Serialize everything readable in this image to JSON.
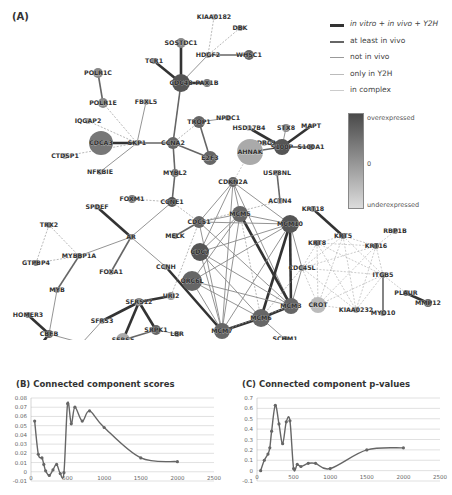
{
  "panels": {
    "a_label": "(A)",
    "b_title": "(B) Connected component scores",
    "c_title": "(C) Connected component p-values"
  },
  "legend": {
    "edges": [
      {
        "label": "in vitro + in vivo + Y2H",
        "color": "#333333",
        "width": 3
      },
      {
        "label": "at least in vivo",
        "color": "#666666",
        "width": 2
      },
      {
        "label": "not in vivo",
        "color": "#999999",
        "width": 1.2
      },
      {
        "label": "only in Y2H",
        "color": "#bbbbbb",
        "width": 1.2
      },
      {
        "label": "in complex",
        "color": "#cccccc",
        "width": 1
      }
    ],
    "colorbar": {
      "top": "overexpressed",
      "mid": "0",
      "bottom": "underexpressed"
    }
  },
  "network": {
    "nodes": [
      {
        "id": "KIAA0182",
        "x": 214,
        "y": 17,
        "r": 3,
        "c": "#bbb"
      },
      {
        "id": "DBK",
        "x": 240,
        "y": 28,
        "r": 3,
        "c": "#888"
      },
      {
        "id": "SOSTDC1",
        "x": 181,
        "y": 43,
        "r": 5,
        "c": "#888"
      },
      {
        "id": "HDGF2",
        "x": 208,
        "y": 55,
        "r": 3,
        "c": "#999"
      },
      {
        "id": "WHSC1",
        "x": 249,
        "y": 55,
        "r": 5,
        "c": "#666"
      },
      {
        "id": "TCR1",
        "x": 154,
        "y": 61,
        "r": 3,
        "c": "#888"
      },
      {
        "id": "CDC48",
        "x": 181,
        "y": 83,
        "r": 9,
        "c": "#555"
      },
      {
        "id": "PAX1B",
        "x": 207,
        "y": 83,
        "r": 4,
        "c": "#777"
      },
      {
        "id": "POLR1C",
        "x": 98,
        "y": 73,
        "r": 5,
        "c": "#888"
      },
      {
        "id": "POLR1E",
        "x": 103,
        "y": 103,
        "r": 5,
        "c": "#888"
      },
      {
        "id": "FBXL5",
        "x": 146,
        "y": 102,
        "r": 3,
        "c": "#999"
      },
      {
        "id": "IQGAP2",
        "x": 88,
        "y": 121,
        "r": 3,
        "c": "#aaa"
      },
      {
        "id": "TROP1",
        "x": 199,
        "y": 122,
        "r": 6,
        "c": "#666"
      },
      {
        "id": "NPDC1",
        "x": 228,
        "y": 118,
        "r": 3,
        "c": "#999"
      },
      {
        "id": "CDCA3",
        "x": 101,
        "y": 143,
        "r": 12,
        "c": "#777"
      },
      {
        "id": "SKP1",
        "x": 137,
        "y": 143,
        "r": 3,
        "c": "#999"
      },
      {
        "id": "CCNA2",
        "x": 173,
        "y": 143,
        "r": 6,
        "c": "#666"
      },
      {
        "id": "E2F3",
        "x": 210,
        "y": 158,
        "r": 7,
        "c": "#666"
      },
      {
        "id": "CTDSP1",
        "x": 65,
        "y": 156,
        "r": 3,
        "c": "#aaa"
      },
      {
        "id": "NFKBIE",
        "x": 100,
        "y": 172,
        "r": 3,
        "c": "#aaa"
      },
      {
        "id": "MYBL2",
        "x": 175,
        "y": 173,
        "r": 4,
        "c": "#777"
      },
      {
        "id": "FOXM1",
        "x": 132,
        "y": 199,
        "r": 4,
        "c": "#777"
      },
      {
        "id": "CCNE1",
        "x": 172,
        "y": 202,
        "r": 5,
        "c": "#555"
      },
      {
        "id": "SPDEF",
        "x": 97,
        "y": 207,
        "r": 3,
        "c": "#aaa"
      },
      {
        "id": "TRX2",
        "x": 49,
        "y": 225,
        "r": 3,
        "c": "#777"
      },
      {
        "id": "AR",
        "x": 131,
        "y": 237,
        "r": 3,
        "c": "#888"
      },
      {
        "id": "GTPBP4",
        "x": 36,
        "y": 263,
        "r": 3,
        "c": "#777"
      },
      {
        "id": "MYBBP1A",
        "x": 79,
        "y": 256,
        "r": 3,
        "c": "#777"
      },
      {
        "id": "FOXA1",
        "x": 111,
        "y": 272,
        "r": 3,
        "c": "#aaa"
      },
      {
        "id": "MYB",
        "x": 57,
        "y": 290,
        "r": 3,
        "c": "#888"
      },
      {
        "id": "HOMER3",
        "x": 28,
        "y": 315,
        "r": 3,
        "c": "#777"
      },
      {
        "id": "CBFB",
        "x": 49,
        "y": 334,
        "r": 4,
        "c": "#666"
      },
      {
        "id": "CEBPG",
        "x": 31,
        "y": 358,
        "r": 4,
        "c": "#555"
      },
      {
        "id": "TAF9",
        "x": 82,
        "y": 343,
        "r": 3,
        "c": "#aaa"
      },
      {
        "id": "CCNH",
        "x": 166,
        "y": 267,
        "r": 3,
        "c": "#999"
      },
      {
        "id": "URI2",
        "x": 171,
        "y": 296,
        "r": 4,
        "c": "#999"
      },
      {
        "id": "SFRS12",
        "x": 139,
        "y": 302,
        "r": 4,
        "c": "#888"
      },
      {
        "id": "SFRS3",
        "x": 102,
        "y": 321,
        "r": 3,
        "c": "#aaa"
      },
      {
        "id": "SRPK1",
        "x": 156,
        "y": 330,
        "r": 5,
        "c": "#666"
      },
      {
        "id": "LBR",
        "x": 177,
        "y": 334,
        "r": 3,
        "c": "#888"
      },
      {
        "id": "SFRS5",
        "x": 123,
        "y": 340,
        "r": 7,
        "c": "#aaa"
      },
      {
        "id": "HSD17B4",
        "x": 249,
        "y": 128,
        "r": 3,
        "c": "#bbb"
      },
      {
        "id": "STX8",
        "x": 286,
        "y": 128,
        "r": 4,
        "c": "#888"
      },
      {
        "id": "MAPT",
        "x": 311,
        "y": 126,
        "r": 2,
        "c": "#888"
      },
      {
        "id": "NDRG1",
        "x": 264,
        "y": 143,
        "r": 3,
        "c": "#aaa"
      },
      {
        "id": "AHNAK",
        "x": 250,
        "y": 152,
        "r": 13,
        "c": "#aaa"
      },
      {
        "id": "S100P",
        "x": 282,
        "y": 147,
        "r": 8,
        "c": "#555"
      },
      {
        "id": "S100A1",
        "x": 311,
        "y": 147,
        "r": 3,
        "c": "#777"
      },
      {
        "id": "USP8NL",
        "x": 277,
        "y": 173,
        "r": 3,
        "c": "#999"
      },
      {
        "id": "CDKN2A",
        "x": 233,
        "y": 182,
        "r": 5,
        "c": "#666"
      },
      {
        "id": "ACTN4",
        "x": 280,
        "y": 201,
        "r": 3,
        "c": "#aaa"
      },
      {
        "id": "KRT18",
        "x": 313,
        "y": 209,
        "r": 3,
        "c": "#888"
      },
      {
        "id": "MCM5",
        "x": 240,
        "y": 214,
        "r": 8,
        "c": "#666"
      },
      {
        "id": "MCM10",
        "x": 290,
        "y": 224,
        "r": 9,
        "c": "#555"
      },
      {
        "id": "CDC51",
        "x": 199,
        "y": 222,
        "r": 6,
        "c": "#666"
      },
      {
        "id": "MELK",
        "x": 175,
        "y": 236,
        "r": 3,
        "c": "#777"
      },
      {
        "id": "CDC7",
        "x": 200,
        "y": 252,
        "r": 9,
        "c": "#555"
      },
      {
        "id": "ORC6L",
        "x": 192,
        "y": 281,
        "r": 10,
        "c": "#666"
      },
      {
        "id": "RBP1B",
        "x": 395,
        "y": 231,
        "r": 3,
        "c": "#888"
      },
      {
        "id": "KRT5",
        "x": 343,
        "y": 236,
        "r": 3,
        "c": "#666"
      },
      {
        "id": "KRT8",
        "x": 317,
        "y": 243,
        "r": 3,
        "c": "#666"
      },
      {
        "id": "KRT16",
        "x": 376,
        "y": 246,
        "r": 3,
        "c": "#666"
      },
      {
        "id": "CDC45L",
        "x": 302,
        "y": 268,
        "r": 3,
        "c": "#888"
      },
      {
        "id": "ITGB5",
        "x": 383,
        "y": 275,
        "r": 3,
        "c": "#888"
      },
      {
        "id": "PLAUR",
        "x": 406,
        "y": 293,
        "r": 3,
        "c": "#666"
      },
      {
        "id": "MMP12",
        "x": 428,
        "y": 303,
        "r": 4,
        "c": "#666"
      },
      {
        "id": "CROT",
        "x": 318,
        "y": 305,
        "r": 8,
        "c": "#bbb"
      },
      {
        "id": "KIAA0232",
        "x": 356,
        "y": 310,
        "r": 3,
        "c": "#999"
      },
      {
        "id": "MYO10",
        "x": 383,
        "y": 313,
        "r": 3,
        "c": "#888"
      },
      {
        "id": "MCM3",
        "x": 291,
        "y": 306,
        "r": 8,
        "c": "#666"
      },
      {
        "id": "MCM6",
        "x": 261,
        "y": 318,
        "r": 9,
        "c": "#666"
      },
      {
        "id": "MCM7",
        "x": 222,
        "y": 331,
        "r": 8,
        "c": "#666"
      },
      {
        "id": "SCHM1",
        "x": 285,
        "y": 339,
        "r": 3,
        "c": "#666"
      }
    ],
    "edges": [
      [
        "KIAA0182",
        "HDGF2",
        3
      ],
      [
        "DBK",
        "HDGF2",
        3
      ],
      [
        "HDGF2",
        "WHSC1",
        1
      ],
      [
        "HDGF2",
        "CDC48",
        2
      ],
      [
        "SOSTDC1",
        "CDC48",
        0
      ],
      [
        "TCR1",
        "CDC48",
        0
      ],
      [
        "CDC48",
        "PAX1B",
        0
      ],
      [
        "CDC48",
        "CCNA2",
        1
      ],
      [
        "POLR1C",
        "POLR1E",
        1
      ],
      [
        "POLR1E",
        "SKP1",
        3
      ],
      [
        "IQGAP2",
        "SKP1",
        3
      ],
      [
        "FBXL5",
        "SKP1",
        2
      ],
      [
        "CDCA3",
        "SKP1",
        0
      ],
      [
        "SKP1",
        "CCNA2",
        1
      ],
      [
        "CTDSP1",
        "SKP1",
        3
      ],
      [
        "NFKBIE",
        "SKP1",
        2
      ],
      [
        "CCNA2",
        "E2F3",
        1
      ],
      [
        "CCNA2",
        "TROP1",
        3
      ],
      [
        "TROP1",
        "E2F3",
        1
      ],
      [
        "TROP1",
        "NPDC1",
        2
      ],
      [
        "CCNA2",
        "MYBL2",
        1
      ],
      [
        "MYBL2",
        "CCNE1",
        1
      ],
      [
        "FOXM1",
        "CCNE1",
        3
      ],
      [
        "CCNE1",
        "AR",
        2
      ],
      [
        "CCNE1",
        "CDC51",
        3
      ],
      [
        "SPDEF",
        "AR",
        0
      ],
      [
        "AR",
        "MYBBP1A",
        2
      ],
      [
        "AR",
        "FOXA1",
        1
      ],
      [
        "AR",
        "CCNH",
        2
      ],
      [
        "TRX2",
        "GTPBP4",
        3
      ],
      [
        "TRX2",
        "MYBBP1A",
        3
      ],
      [
        "GTPBP4",
        "MYBBP1A",
        3
      ],
      [
        "MYBBP1A",
        "MYB",
        1
      ],
      [
        "MYB",
        "CBFB",
        2
      ],
      [
        "HOMER3",
        "CBFB",
        0
      ],
      [
        "CBFB",
        "CEBPG",
        0
      ],
      [
        "CBFB",
        "TAF9",
        2
      ],
      [
        "TAF9",
        "SFRS3",
        2
      ],
      [
        "SFRS3",
        "SFRS12",
        0
      ],
      [
        "SFRS12",
        "URI2",
        0
      ],
      [
        "SFRS12",
        "SFRS5",
        0
      ],
      [
        "SFRS12",
        "SRPK1",
        0
      ],
      [
        "SFRS5",
        "SRPK1",
        1
      ],
      [
        "SRPK1",
        "LBR",
        2
      ],
      [
        "CCNH",
        "MCM7",
        0
      ],
      [
        "URI2",
        "CDC51",
        3
      ],
      [
        "HSD17B4",
        "S100P",
        0
      ],
      [
        "STX8",
        "S100P",
        2
      ],
      [
        "MAPT",
        "S100P",
        0
      ],
      [
        "NDRG1",
        "S100P",
        1
      ],
      [
        "AHNAK",
        "S100P",
        1
      ],
      [
        "S100P",
        "S100A1",
        1
      ],
      [
        "AHNAK",
        "CDKN2A",
        4
      ],
      [
        "USP8NL",
        "ACTN4",
        1
      ],
      [
        "ACTN4",
        "CDC51",
        3
      ],
      [
        "KRT18",
        "KRT5",
        0
      ],
      [
        "CDKN2A",
        "MCM5",
        2
      ],
      [
        "CDKN2A",
        "MCM10",
        2
      ],
      [
        "CDKN2A",
        "CDC51",
        2
      ],
      [
        "CDKN2A",
        "MCM3",
        2
      ],
      [
        "CDKN2A",
        "CDC7",
        2
      ],
      [
        "CDKN2A",
        "MCM7",
        2
      ],
      [
        "MCM5",
        "MCM10",
        2
      ],
      [
        "MCM5",
        "CDC51",
        2
      ],
      [
        "MCM5",
        "MCM3",
        0
      ],
      [
        "MCM5",
        "MCM7",
        2
      ],
      [
        "MCM5",
        "MCM6",
        3
      ],
      [
        "MCM5",
        "ORC6L",
        2
      ],
      [
        "MCM5",
        "CDC7",
        2
      ],
      [
        "MCM10",
        "CDC51",
        2
      ],
      [
        "MCM10",
        "MCM6",
        0
      ],
      [
        "MCM10",
        "MCM3",
        0
      ],
      [
        "MCM10",
        "MCM7",
        2
      ],
      [
        "MCM10",
        "CDC7",
        2
      ],
      [
        "MCM10",
        "CDC45L",
        2
      ],
      [
        "MCM10",
        "ORC6L",
        2
      ],
      [
        "CDC51",
        "MCM7",
        2
      ],
      [
        "CDC51",
        "MCM3",
        2
      ],
      [
        "CDC51",
        "MELK",
        1
      ],
      [
        "CDC7",
        "MCM7",
        2
      ],
      [
        "CDC7",
        "MCM3",
        2
      ],
      [
        "CDC7",
        "MCM6",
        2
      ],
      [
        "ORC6L",
        "MCM7",
        2
      ],
      [
        "ORC6L",
        "MCM3",
        2
      ],
      [
        "ORC6L",
        "MCM6",
        2
      ],
      [
        "MCM7",
        "MCM6",
        0
      ],
      [
        "MCM6",
        "MCM3",
        0
      ],
      [
        "MCM6",
        "SCHM1",
        2
      ],
      [
        "MCM7",
        "MCM3",
        3
      ],
      [
        "CDC45L",
        "MCM3",
        2
      ],
      [
        "CDC45L",
        "MCM6",
        3
      ],
      [
        "KRT5",
        "KRT8",
        4
      ],
      [
        "KRT5",
        "KRT16",
        4
      ],
      [
        "KRT5",
        "CDC45L",
        4
      ],
      [
        "KRT5",
        "ITGB5",
        4
      ],
      [
        "KRT5",
        "CROT",
        4
      ],
      [
        "KRT5",
        "KIAA0232",
        4
      ],
      [
        "KRT8",
        "KRT16",
        4
      ],
      [
        "KRT8",
        "CDC45L",
        4
      ],
      [
        "KRT8",
        "ITGB5",
        4
      ],
      [
        "KRT8",
        "CROT",
        4
      ],
      [
        "KRT8",
        "KIAA0232",
        4
      ],
      [
        "KRT16",
        "CDC45L",
        4
      ],
      [
        "KRT16",
        "ITGB5",
        4
      ],
      [
        "KRT16",
        "CROT",
        4
      ],
      [
        "KRT16",
        "KIAA0232",
        4
      ],
      [
        "KRT16",
        "RBP1B",
        4
      ],
      [
        "CDC45L",
        "ITGB5",
        4
      ],
      [
        "CDC45L",
        "CROT",
        4
      ],
      [
        "CDC45L",
        "KIAA0232",
        4
      ],
      [
        "ITGB5",
        "CROT",
        4
      ],
      [
        "ITGB5",
        "KIAA0232",
        4
      ],
      [
        "CROT",
        "KIAA0232",
        4
      ],
      [
        "ITGB5",
        "MYO10",
        1
      ],
      [
        "ITGB5",
        "PLAUR",
        4
      ],
      [
        "PLAUR",
        "MMP12",
        0
      ]
    ]
  },
  "chart_data": [
    {
      "type": "line",
      "title": "(B) Connected component scores",
      "xlabel": "",
      "ylabel": "",
      "xlim": [
        0,
        2500
      ],
      "ylim": [
        -0.01,
        0.08
      ],
      "xticks": [
        0,
        500,
        1000,
        1500,
        2000,
        2500
      ],
      "yticks": [
        -0.01,
        0,
        0.01,
        0.02,
        0.03,
        0.04,
        0.05,
        0.06,
        0.07,
        0.08
      ],
      "grid": true,
      "x": [
        50,
        100,
        150,
        175,
        200,
        250,
        300,
        350,
        400,
        450,
        500,
        550,
        600,
        700,
        800,
        1000,
        1500,
        2000
      ],
      "values": [
        0.055,
        0.019,
        0.015,
        0.008,
        0.001,
        -0.004,
        0.002,
        0.008,
        -0.002,
        -0.001,
        0.074,
        0.052,
        0.07,
        0.055,
        0.066,
        0.048,
        0.015,
        0.011
      ]
    },
    {
      "type": "line",
      "title": "(C) Connected component p-values",
      "xlabel": "",
      "ylabel": "",
      "xlim": [
        0,
        2500
      ],
      "ylim": [
        -0.1,
        0.7
      ],
      "xticks": [
        0,
        500,
        1000,
        1500,
        2000,
        2500
      ],
      "yticks": [
        -0.1,
        0,
        0.1,
        0.2,
        0.3,
        0.4,
        0.5,
        0.6,
        0.7
      ],
      "grid": true,
      "x": [
        50,
        100,
        150,
        175,
        200,
        250,
        300,
        350,
        400,
        450,
        500,
        550,
        600,
        700,
        800,
        1000,
        1500,
        2000
      ],
      "values": [
        0.0,
        0.1,
        0.16,
        0.22,
        0.38,
        0.63,
        0.45,
        0.26,
        0.47,
        0.48,
        0.02,
        0.06,
        0.04,
        0.07,
        0.07,
        0.02,
        0.2,
        0.22
      ]
    }
  ]
}
